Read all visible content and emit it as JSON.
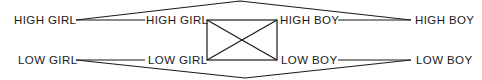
{
  "diagram": {
    "colors": {
      "line": "#1a1a1a",
      "background": "#ffffff"
    },
    "left_column": {
      "top": "HIGH GIRL",
      "bottom": "LOW GIRL"
    },
    "center_left": {
      "top": "HIGH GIRL",
      "bottom": "LOW GIRL"
    },
    "center_right": {
      "top": "HIGH BOY",
      "bottom": "LOW BOY"
    },
    "right_column": {
      "top": "HIGH BOY",
      "bottom": "LOW BOY"
    }
  }
}
